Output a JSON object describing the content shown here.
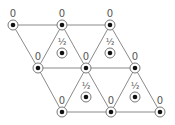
{
  "diagram": {
    "type": "triangular-lattice",
    "edge_color": "#8a8a8a",
    "node_ring_color": "#777777",
    "node_dot_color": "#111111",
    "label_color": "#555555",
    "nodes": [
      {
        "id": "n1",
        "x": 13,
        "y": 25,
        "label": "0"
      },
      {
        "id": "n2",
        "x": 62,
        "y": 25,
        "label": "0"
      },
      {
        "id": "n3",
        "x": 110,
        "y": 25,
        "label": "0"
      },
      {
        "id": "n4",
        "x": 38,
        "y": 68,
        "label": "0"
      },
      {
        "id": "n5",
        "x": 86,
        "y": 68,
        "label": "0"
      },
      {
        "id": "n6",
        "x": 135,
        "y": 68,
        "label": "0"
      },
      {
        "id": "n7",
        "x": 62,
        "y": 112,
        "label": "0"
      },
      {
        "id": "n8",
        "x": 111,
        "y": 112,
        "label": "0"
      },
      {
        "id": "n9",
        "x": 160,
        "y": 112,
        "label": "0"
      }
    ],
    "half_nodes": [
      {
        "id": "h1",
        "x": 62,
        "y": 53,
        "label": "½"
      },
      {
        "id": "h2",
        "x": 110,
        "y": 53,
        "label": "½"
      },
      {
        "id": "h3",
        "x": 86,
        "y": 97,
        "label": "½"
      },
      {
        "id": "h4",
        "x": 135,
        "y": 97,
        "label": "½"
      }
    ],
    "edges": [
      [
        "n1",
        "n2"
      ],
      [
        "n2",
        "n3"
      ],
      [
        "n4",
        "n5"
      ],
      [
        "n5",
        "n6"
      ],
      [
        "n7",
        "n8"
      ],
      [
        "n8",
        "n9"
      ],
      [
        "n1",
        "n4"
      ],
      [
        "n4",
        "n7"
      ],
      [
        "n2",
        "n4"
      ],
      [
        "n2",
        "n5"
      ],
      [
        "n5",
        "n8"
      ],
      [
        "n5",
        "n7"
      ],
      [
        "n3",
        "n5"
      ],
      [
        "n3",
        "n6"
      ],
      [
        "n6",
        "n9"
      ],
      [
        "n6",
        "n8"
      ]
    ]
  }
}
